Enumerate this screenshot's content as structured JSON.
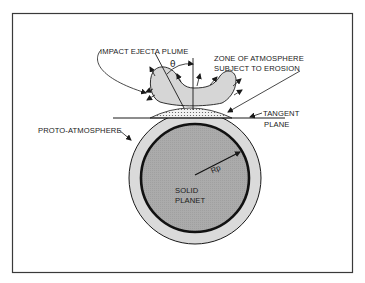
{
  "diagram": {
    "labels": {
      "plume": "IMPACT EJECTA PLUME",
      "zone_line1": "ZONE OF ATMOSPHERE",
      "zone_line2": "SUBJECT TO EROSION",
      "tangent_line1": "TANGENT",
      "tangent_line2": "PLANE",
      "proto_atmosphere": "PROTO-ATMOSPHERE",
      "radius": "Rp",
      "angle": "θ",
      "planet_line1": "SOLID",
      "planet_line2": "PLANET"
    },
    "colors": {
      "background": "#ffffff",
      "frame": "#3a3a3a",
      "atmosphere_fill": "#d9d9d9",
      "planet_fill": "#a9a9a9",
      "plume_fill": "#d6d6d6",
      "ink": "#1a1a1a"
    }
  }
}
